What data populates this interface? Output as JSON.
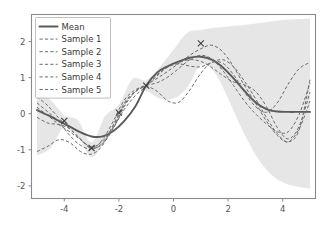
{
  "chart_data": {
    "type": "line",
    "title": "",
    "xlabel": "",
    "ylabel": "",
    "xlim": [
      -5.2,
      5.2
    ],
    "ylim": [
      -2.35,
      2.75
    ],
    "xticks": [
      -4,
      -2,
      0,
      2,
      4
    ],
    "xtick_labels": [
      "-4",
      "-2",
      "0",
      "2",
      "4"
    ],
    "yticks": [
      -2,
      -1,
      0,
      1,
      2
    ],
    "ytick_labels": [
      "-2",
      "-1",
      "0",
      "1",
      "2"
    ],
    "grid": false,
    "legend_position": "upper left",
    "legend_entries": [
      {
        "label": "Mean",
        "style": "solid"
      },
      {
        "label": "Sample 1",
        "style": "dashed"
      },
      {
        "label": "Sample 2",
        "style": "dashed"
      },
      {
        "label": "Sample 3",
        "style": "dashed"
      },
      {
        "label": "Sample 4",
        "style": "dashed"
      },
      {
        "label": "Sample 5",
        "style": "dashed"
      }
    ],
    "colors": {
      "mean": "#5a5a5a",
      "sample": "#6b6b6b",
      "band": "#9e9e9e",
      "marker": "#3d3d3d",
      "spine": "#8a8a8a",
      "tick_text": "#555555",
      "background": "#ffffff"
    },
    "observations": {
      "name": "Observed data points",
      "marker": "x",
      "x": [
        -4,
        -3,
        -2,
        -1,
        1
      ],
      "y": [
        -0.2,
        -0.95,
        0.03,
        0.78,
        1.95
      ]
    },
    "confidence_band": {
      "name": "Uncertainty band (mean +/- 2 std)",
      "x": [
        -5,
        -4.5,
        -4,
        -3.5,
        -3,
        -2.5,
        -2,
        -1.5,
        -1,
        -0.5,
        0,
        0.5,
        1,
        1.5,
        2,
        2.5,
        3,
        3.5,
        4,
        4.5,
        5
      ],
      "upper": [
        0.62,
        0.38,
        -0.04,
        -0.18,
        -0.79,
        -0.06,
        0.25,
        0.96,
        0.93,
        1.3,
        1.77,
        2.24,
        2.32,
        2.38,
        2.42,
        2.45,
        2.5,
        2.55,
        2.6,
        2.62,
        2.64
      ],
      "lower": [
        -1.16,
        -0.95,
        -0.37,
        -0.63,
        -1.2,
        -0.74,
        -0.17,
        0.61,
        0.63,
        0.42,
        0.42,
        0.72,
        1.35,
        1.15,
        0.42,
        -0.42,
        -1.13,
        -1.63,
        -1.9,
        -2.02,
        -2.08
      ]
    },
    "series": [
      {
        "name": "Mean",
        "style": "solid",
        "x": [
          -5,
          -4.6,
          -4.2,
          -3.8,
          -3.4,
          -3,
          -2.6,
          -2.2,
          -1.8,
          -1.4,
          -1,
          -0.6,
          -0.2,
          0.2,
          0.6,
          1,
          1.4,
          1.8,
          2.2,
          2.6,
          3,
          3.4,
          3.8,
          4.2,
          4.6,
          5
        ],
        "y": [
          0.1,
          -0.04,
          -0.2,
          -0.36,
          -0.52,
          -0.63,
          -0.63,
          -0.48,
          -0.2,
          0.2,
          0.78,
          1.14,
          1.32,
          1.45,
          1.55,
          1.58,
          1.5,
          1.29,
          0.98,
          0.63,
          0.32,
          0.13,
          0.06,
          0.05,
          0.05,
          0.05
        ]
      },
      {
        "name": "Sample 1",
        "style": "dashed",
        "x": [
          -5,
          -4.6,
          -4.2,
          -3.8,
          -3.4,
          -3,
          -2.6,
          -2.2,
          -1.8,
          -1.4,
          -1,
          -0.6,
          -0.2,
          0.2,
          0.6,
          1,
          1.4,
          1.8,
          2.2,
          2.6,
          3,
          3.4,
          3.8,
          4.2,
          4.6,
          5
        ],
        "y": [
          0.47,
          0.22,
          -0.12,
          -0.42,
          -0.72,
          -0.95,
          -0.84,
          -0.4,
          0.2,
          0.62,
          0.8,
          0.98,
          1.18,
          1.4,
          1.62,
          1.8,
          1.9,
          1.72,
          1.3,
          0.78,
          0.3,
          -0.2,
          -0.6,
          -0.78,
          -0.42,
          0.35
        ]
      },
      {
        "name": "Sample 2",
        "style": "dashed",
        "x": [
          -5,
          -4.6,
          -4.2,
          -3.8,
          -3.4,
          -3,
          -2.6,
          -2.2,
          -1.8,
          -1.4,
          -1,
          -0.6,
          -0.2,
          0.2,
          0.6,
          1,
          1.4,
          1.8,
          2.2,
          2.6,
          3,
          3.4,
          3.8,
          4.2,
          4.6,
          5
        ],
        "y": [
          0.3,
          0.05,
          -0.22,
          -0.6,
          -0.88,
          -0.98,
          -0.82,
          -0.38,
          0.12,
          0.5,
          0.76,
          1.05,
          1.3,
          1.42,
          1.5,
          1.45,
          1.28,
          1.06,
          0.88,
          0.8,
          0.62,
          0.2,
          -0.38,
          -0.7,
          -0.35,
          0.6
        ]
      },
      {
        "name": "Sample 3",
        "style": "dashed",
        "x": [
          -5,
          -4.6,
          -4.2,
          -3.8,
          -3.4,
          -3,
          -2.6,
          -2.2,
          -1.8,
          -1.4,
          -1,
          -0.6,
          -0.2,
          0.2,
          0.6,
          1,
          1.4,
          1.8,
          2.2,
          2.6,
          3,
          3.4,
          3.8,
          4.2,
          4.6,
          5
        ],
        "y": [
          -0.1,
          -0.26,
          -0.3,
          -0.42,
          -0.7,
          -0.96,
          -0.72,
          -0.2,
          0.38,
          0.66,
          0.78,
          0.86,
          1.02,
          1.26,
          1.5,
          1.62,
          1.52,
          1.2,
          0.78,
          0.35,
          0.0,
          -0.28,
          -0.5,
          -0.5,
          -0.02,
          0.85
        ]
      },
      {
        "name": "Sample 4",
        "style": "dashed",
        "x": [
          -5,
          -4.6,
          -4.2,
          -3.8,
          -3.4,
          -3,
          -2.6,
          -2.2,
          -1.8,
          -1.4,
          -1,
          -0.6,
          -0.2,
          0.2,
          0.6,
          1,
          1.4,
          1.8,
          2.2,
          2.6,
          3,
          3.4,
          3.8,
          4.2,
          4.6,
          5
        ],
        "y": [
          -1.05,
          -0.9,
          -0.72,
          -0.8,
          -1.05,
          -1.12,
          -0.88,
          -0.3,
          0.3,
          0.62,
          0.75,
          0.62,
          0.35,
          0.32,
          0.66,
          1.12,
          1.42,
          1.4,
          1.08,
          0.6,
          0.2,
          0.04,
          0.3,
          0.82,
          1.25,
          1.42
        ]
      },
      {
        "name": "Sample 5",
        "style": "dashed",
        "x": [
          -5,
          -4.6,
          -4.2,
          -3.8,
          -3.4,
          -3,
          -2.6,
          -2.2,
          -1.8,
          -1.4,
          -1,
          -0.6,
          -0.2,
          0.2,
          0.6,
          1,
          1.4,
          1.8,
          2.2,
          2.6,
          3,
          3.4,
          3.8,
          4.2,
          4.6,
          5
        ],
        "y": [
          0.18,
          -0.05,
          -0.3,
          -0.5,
          -0.72,
          -0.92,
          -0.76,
          -0.34,
          0.25,
          0.6,
          0.8,
          1.08,
          1.3,
          1.38,
          1.32,
          1.3,
          1.42,
          1.5,
          1.3,
          0.9,
          0.42,
          -0.1,
          -0.55,
          -0.78,
          -0.45,
          0.95
        ]
      }
    ]
  }
}
